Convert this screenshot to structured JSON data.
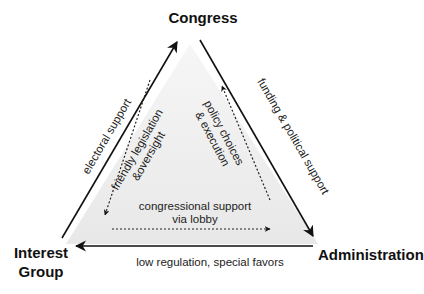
{
  "diagram": {
    "type": "iron-triangle",
    "nodes": {
      "top": {
        "label": "Congress"
      },
      "bottom_left": {
        "line1": "Interest",
        "line2": "Group"
      },
      "bottom_right": {
        "label": "Administration"
      }
    },
    "outer_edges": {
      "left": {
        "label": "electoral support",
        "from": "Interest Group",
        "to": "Congress"
      },
      "right": {
        "label": "funding & political support",
        "from": "Congress",
        "to": "Administration"
      },
      "bottom": {
        "label": "low regulation, special favors",
        "from": "Administration",
        "to": "Interest Group"
      }
    },
    "inner_edges": {
      "left": {
        "line1": "friendly legislation",
        "line2": "&oversight",
        "from": "Congress",
        "to": "Interest Group"
      },
      "right": {
        "line1": "policy choices",
        "line2": "& execution",
        "from": "Administration",
        "to": "Congress"
      },
      "bottom": {
        "line1": "congressional support",
        "line2": "via lobby",
        "from": "Interest Group",
        "to": "Administration"
      }
    },
    "colors": {
      "arrow": "#111111",
      "shade": "#ececec",
      "text": "#222222"
    }
  }
}
